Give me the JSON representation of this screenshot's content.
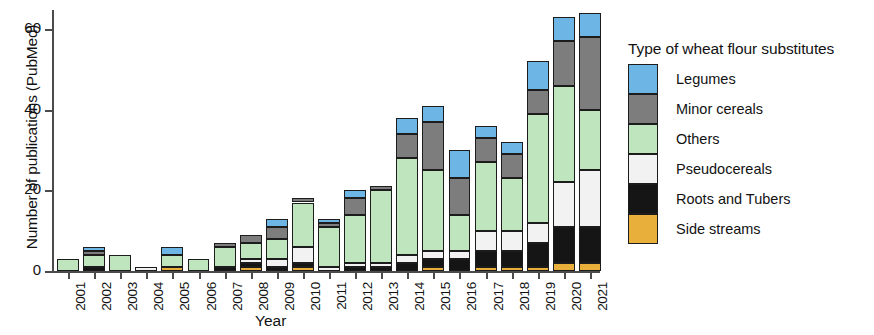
{
  "chart_data": {
    "type": "bar",
    "subtype": "stacked-bar",
    "title": "",
    "xlabel": "Year",
    "ylabel": "Number of publications (PubMed)",
    "ylim": [
      0,
      65
    ],
    "yticks": [
      0,
      20,
      40,
      60
    ],
    "ytick_labels": [
      "0",
      "20",
      "40",
      "60"
    ],
    "grid": false,
    "legend_title": "Type of wheat flour substitutes",
    "legend_position": "right",
    "stack_order_top_to_bottom": [
      "Legumes",
      "Minor cereals",
      "Others",
      "Pseudocereals",
      "Roots and Tubers",
      "Side streams"
    ],
    "categories": [
      "2001",
      "2002",
      "2003",
      "2004",
      "2005",
      "2006",
      "2007",
      "2008",
      "2009",
      "2010",
      "2011",
      "2012",
      "2013",
      "2014",
      "2015",
      "2016",
      "2017",
      "2018",
      "2019",
      "2020",
      "2021"
    ],
    "series": [
      {
        "name": "Side streams",
        "color": "#e8b03a",
        "values": [
          0,
          0,
          0,
          0,
          1,
          0,
          0,
          1,
          0,
          1,
          0,
          0,
          0,
          0,
          1,
          0,
          1,
          1,
          1,
          2,
          2
        ]
      },
      {
        "name": "Roots and Tubers",
        "color": "#151515",
        "values": [
          0,
          1,
          0,
          0,
          0,
          0,
          1,
          1,
          1,
          1,
          0,
          1,
          1,
          2,
          2,
          3,
          4,
          4,
          6,
          9,
          9
        ]
      },
      {
        "name": "Pseudocereals",
        "color": "#f2f2f2",
        "values": [
          0,
          0,
          0,
          1,
          0,
          0,
          0,
          1,
          2,
          4,
          1,
          1,
          1,
          2,
          2,
          2,
          5,
          5,
          5,
          11,
          14
        ]
      },
      {
        "name": "Others",
        "color": "#bfe5bf",
        "values": [
          3,
          3,
          4,
          0,
          3,
          3,
          5,
          4,
          5,
          11,
          10,
          12,
          18,
          24,
          20,
          9,
          17,
          13,
          27,
          24,
          15
        ]
      },
      {
        "name": "Minor cereals",
        "color": "#7d7d7d",
        "values": [
          0,
          1,
          0,
          0,
          0,
          0,
          1,
          2,
          3,
          1,
          1,
          4,
          1,
          6,
          12,
          9,
          6,
          6,
          6,
          11,
          18
        ]
      },
      {
        "name": "Legumes",
        "color": "#6cb5e4",
        "values": [
          0,
          1,
          0,
          0,
          2,
          0,
          0,
          0,
          2,
          0,
          1,
          2,
          0,
          4,
          4,
          7,
          3,
          3,
          7,
          6,
          6
        ]
      }
    ],
    "totals": [
      3,
      6,
      4,
      1,
      6,
      3,
      7,
      9,
      13,
      18,
      13,
      20,
      21,
      38,
      41,
      30,
      36,
      32,
      52,
      63,
      64
    ]
  },
  "legend": {
    "title": "Type of wheat flour substitutes",
    "items": [
      {
        "label": "Legumes",
        "color": "#6cb5e4"
      },
      {
        "label": "Minor cereals",
        "color": "#7d7d7d"
      },
      {
        "label": "Others",
        "color": "#bfe5bf"
      },
      {
        "label": "Pseudocereals",
        "color": "#f2f2f2"
      },
      {
        "label": "Roots and Tubers",
        "color": "#151515"
      },
      {
        "label": "Side streams",
        "color": "#e8b03a"
      }
    ]
  },
  "axes": {
    "x_title": "Year",
    "y_title": "Number of publications (PubMed)"
  }
}
